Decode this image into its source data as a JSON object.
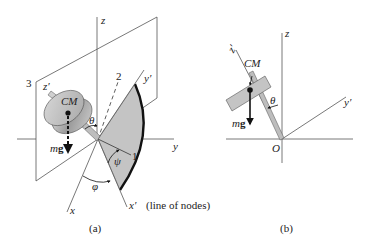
{
  "figure_a": {
    "caption": "(a)",
    "labels": {
      "z": "z",
      "y": "y",
      "x": "x",
      "z_prime": "z′",
      "y_prime": "y′",
      "x_prime": "x′",
      "line_of_nodes": "(line of nodes)",
      "axis_1": "1",
      "axis_2": "2",
      "axis_3": "3",
      "cm": "CM",
      "mg_m": "m",
      "mg_g": "g",
      "theta": "θ",
      "psi": "ψ",
      "phi": "φ"
    }
  },
  "figure_b": {
    "caption": "(b)",
    "labels": {
      "z": "z",
      "z_prime": "z′",
      "y_prime": "y′",
      "origin": "O",
      "cm": "CM",
      "mg_m": "m",
      "mg_g": "g",
      "theta": "θ"
    }
  },
  "colors": {
    "line": "#555555",
    "shade": "#c4c4c4",
    "dark": "#111111"
  }
}
